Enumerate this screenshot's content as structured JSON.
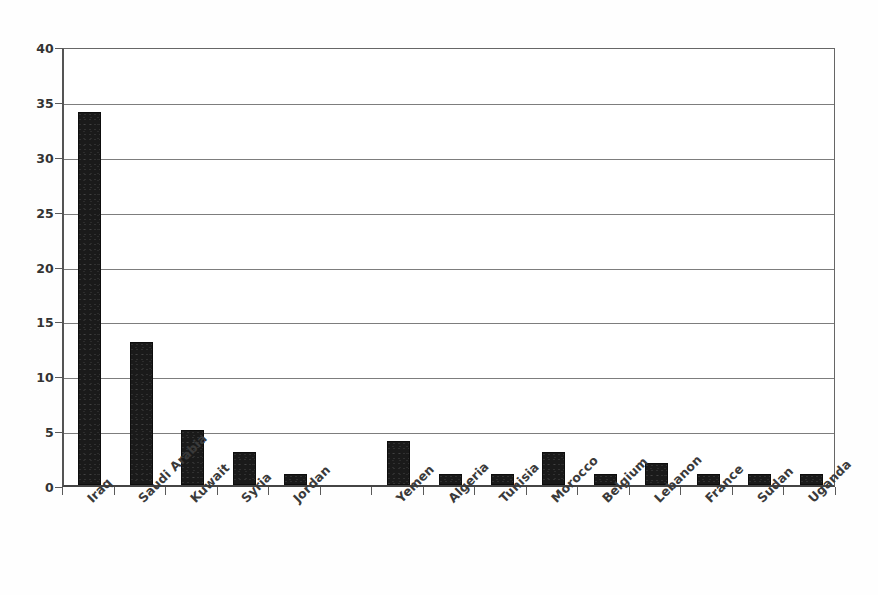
{
  "chart_data": {
    "type": "bar",
    "title": "",
    "subtitle": "",
    "xlabel": "",
    "ylabel": "",
    "ylim": [
      0,
      40
    ],
    "ytick_step": 5,
    "yticks": [
      0,
      5,
      10,
      15,
      20,
      25,
      30,
      35,
      40
    ],
    "ytick_labels": [
      "0",
      "5",
      "10",
      "15",
      "20",
      "25",
      "30",
      "35",
      "40"
    ],
    "grid": true,
    "grid_axis": "y",
    "legend": null,
    "legend_position": "none",
    "bar_color": "#1a1a1a",
    "categories": [
      "Iraq",
      "Saudi Arabia",
      "Kuwait",
      "Syria",
      "Jordan",
      "",
      "Yemen",
      "Algeria",
      "Tunisia",
      "Morocco",
      "Belgium",
      "Lebanon",
      "France",
      "Sudan",
      "Uganda"
    ],
    "values": [
      34,
      13,
      5,
      3,
      1,
      0,
      4,
      1,
      1,
      3,
      1,
      2,
      1,
      1,
      1
    ],
    "xtick_label_rotation": -45,
    "annotations": []
  },
  "axes": {
    "y_axis_name": "y-axis",
    "x_axis_name": "x-axis"
  }
}
